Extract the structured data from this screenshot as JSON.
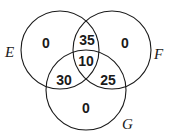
{
  "diagram": {
    "type": "venn-3-set",
    "sets": [
      {
        "name": "E",
        "label": "E"
      },
      {
        "name": "F",
        "label": "F"
      },
      {
        "name": "G",
        "label": "G"
      }
    ],
    "regions": {
      "E_only": "0",
      "F_only": "0",
      "G_only": "0",
      "E_and_F_only": "35",
      "E_and_G_only": "30",
      "F_and_G_only": "25",
      "E_and_F_and_G": "10"
    }
  }
}
